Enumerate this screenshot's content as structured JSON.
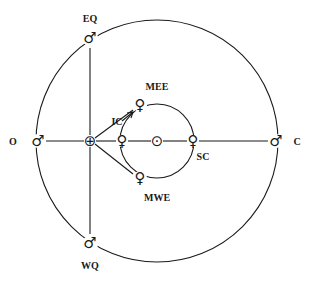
{
  "title": "",
  "symbols": {
    "mars": "♂",
    "venus": "♀",
    "earth": "⊕",
    "sun": "⊙"
  },
  "outer_orbit": {
    "body": "mars",
    "positions": {
      "opposition": "O",
      "conjunction": "C",
      "eastern_quadrature": "EQ",
      "western_quadrature": "WQ"
    }
  },
  "inner_orbit": {
    "body": "venus",
    "positions": {
      "inferior_conjunction": "IC",
      "superior_conjunction": "SC",
      "max_eastern_elongation": "MEE",
      "max_western_elongation": "MWE"
    }
  },
  "center_label": "sun",
  "observer": "earth"
}
